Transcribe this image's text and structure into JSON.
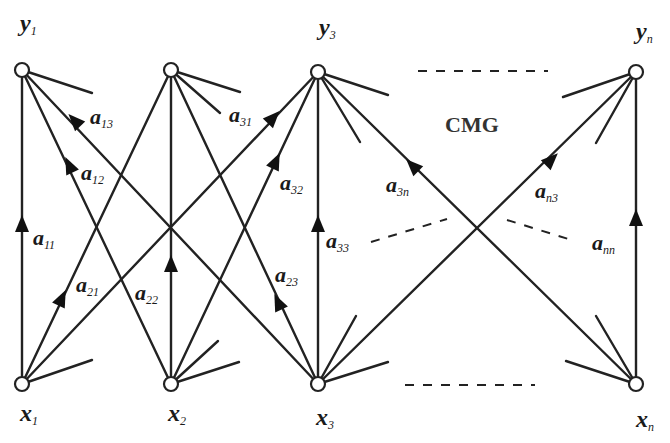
{
  "diagram": {
    "title": "CMG",
    "colors": {
      "stroke": "#222222",
      "background": "#ffffff"
    },
    "output_nodes": [
      {
        "id": "y1",
        "base": "y",
        "sub": "1"
      },
      {
        "id": "y2",
        "base": "",
        "sub": ""
      },
      {
        "id": "y3",
        "base": "y",
        "sub": "3"
      },
      {
        "id": "yn",
        "base": "y",
        "sub": "n"
      }
    ],
    "input_nodes": [
      {
        "id": "x1",
        "base": "x",
        "sub": "1"
      },
      {
        "id": "x2",
        "base": "x",
        "sub": "2"
      },
      {
        "id": "x3",
        "base": "x",
        "sub": "3"
      },
      {
        "id": "xn",
        "base": "x",
        "sub": "n"
      }
    ],
    "edge_labels": [
      {
        "id": "a11",
        "base": "a",
        "sub": "11"
      },
      {
        "id": "a12",
        "base": "a",
        "sub": "12"
      },
      {
        "id": "a13",
        "base": "a",
        "sub": "13"
      },
      {
        "id": "a21",
        "base": "a",
        "sub": "21"
      },
      {
        "id": "a22",
        "base": "a",
        "sub": "22"
      },
      {
        "id": "a23",
        "base": "a",
        "sub": "23"
      },
      {
        "id": "a31",
        "base": "a",
        "sub": "31"
      },
      {
        "id": "a32",
        "base": "a",
        "sub": "32"
      },
      {
        "id": "a33",
        "base": "a",
        "sub": "33"
      },
      {
        "id": "a3n",
        "base": "a",
        "sub": "3n"
      },
      {
        "id": "an3",
        "base": "a",
        "sub": "n3"
      },
      {
        "id": "ann",
        "base": "a",
        "sub": "nn"
      }
    ]
  }
}
